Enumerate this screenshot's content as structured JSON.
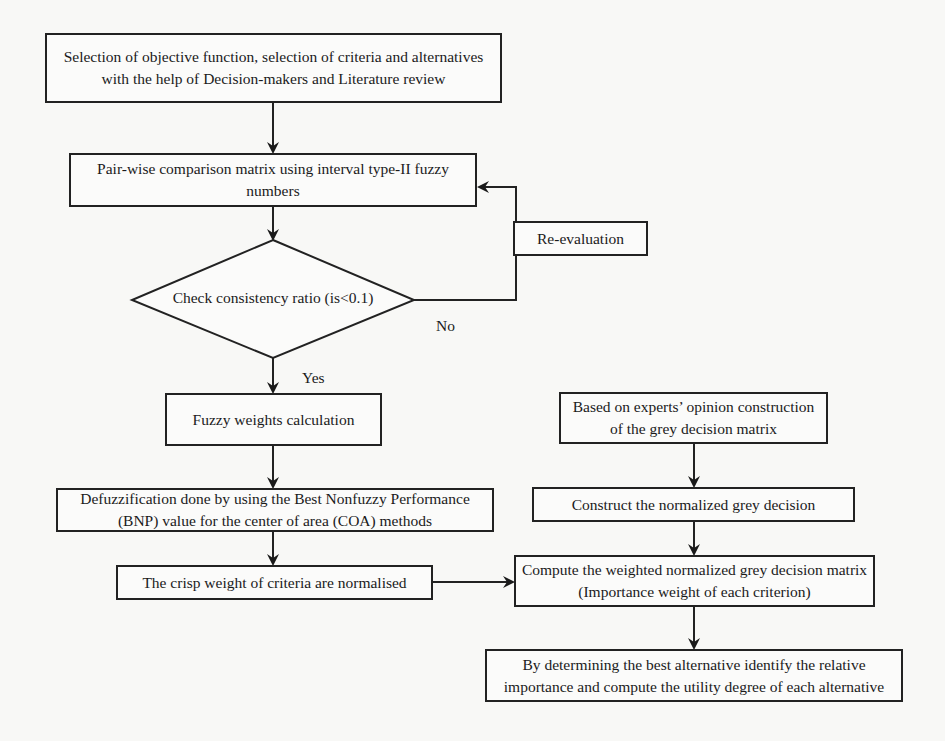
{
  "diagram": {
    "type": "flowchart",
    "nodes": {
      "selection": {
        "label": "Selection of objective function, selection of criteria and alternatives with the help of Decision-makers and Literature review"
      },
      "pairwise": {
        "label": "Pair-wise comparison matrix using interval type-II fuzzy numbers"
      },
      "consistency": {
        "label": "Check consistency ratio (is<0.1)"
      },
      "reevaluation": {
        "label": "Re-evaluation"
      },
      "fuzzy_weights": {
        "label": "Fuzzy weights calculation"
      },
      "defuzzification": {
        "label": "Defuzzification done by using the Best Nonfuzzy Performance (BNP) value for the center of area (COA) methods"
      },
      "crisp_weights": {
        "label": "The crisp weight of criteria are normalised"
      },
      "experts_matrix": {
        "label": "Based on experts’ opinion construction of the grey decision matrix"
      },
      "normalized": {
        "label": "Construct the normalized grey decision"
      },
      "weighted": {
        "label": "Compute the weighted normalized grey decision matrix (Importance weight of each criterion)"
      },
      "best_alternative": {
        "label": "By determining the best alternative identify the relative importance and compute the utility degree of each alternative"
      }
    },
    "edge_labels": {
      "no": "No",
      "yes": "Yes"
    },
    "edges": [
      [
        "selection",
        "pairwise"
      ],
      [
        "pairwise",
        "consistency"
      ],
      [
        "consistency",
        "reevaluation",
        "No"
      ],
      [
        "reevaluation",
        "pairwise"
      ],
      [
        "consistency",
        "fuzzy_weights",
        "Yes"
      ],
      [
        "fuzzy_weights",
        "defuzzification"
      ],
      [
        "defuzzification",
        "crisp_weights"
      ],
      [
        "crisp_weights",
        "weighted"
      ],
      [
        "experts_matrix",
        "normalized"
      ],
      [
        "normalized",
        "weighted"
      ],
      [
        "weighted",
        "best_alternative"
      ]
    ]
  }
}
